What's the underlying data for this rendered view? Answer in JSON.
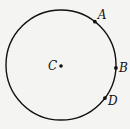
{
  "diagram": {
    "type": "circle-with-points",
    "center": {
      "label": "C"
    },
    "points": [
      {
        "label": "A",
        "angle_deg": 52
      },
      {
        "label": "B",
        "angle_deg": -3
      },
      {
        "label": "D",
        "angle_deg": -37
      }
    ],
    "colors": {
      "stroke": "#111111",
      "background": "#f4f4f2"
    }
  }
}
